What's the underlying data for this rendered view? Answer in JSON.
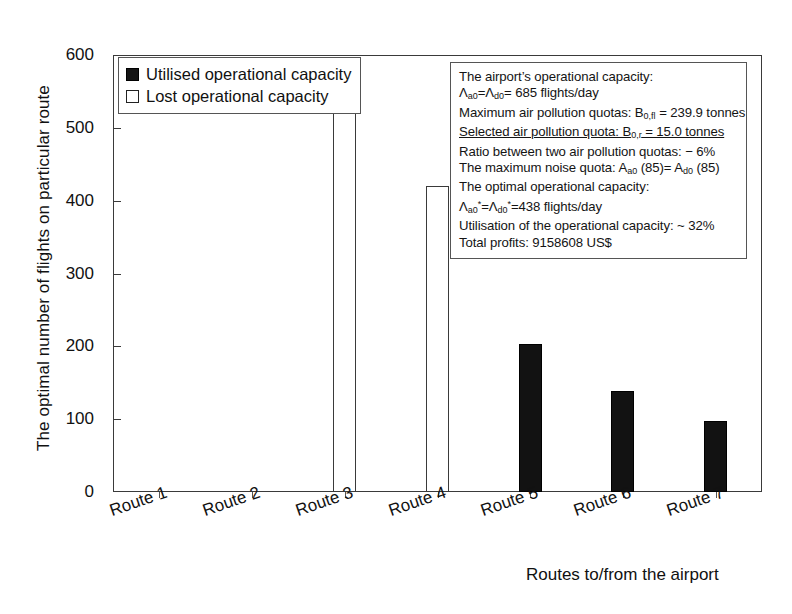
{
  "chart_data": {
    "type": "bar",
    "title": "",
    "xlabel": "Routes to/from the airport",
    "ylabel": "The optimal number of flights on particular route",
    "categories": [
      "Route 1",
      "Route 2",
      "Route 3",
      "Route 4",
      "Route 5",
      "Route 6",
      "Route 7"
    ],
    "values": [
      0,
      0,
      520,
      420,
      203,
      139,
      97
    ],
    "series": [
      {
        "name": "Utilised operational capacity",
        "style": "filled",
        "values": [
          0,
          0,
          0,
          0,
          203,
          139,
          97
        ]
      },
      {
        "name": "Lost operational capacity",
        "style": "hollow",
        "values": [
          0,
          0,
          520,
          420,
          0,
          0,
          0
        ]
      }
    ],
    "ylim": [
      0,
      600
    ],
    "yticks": [
      0,
      100,
      200,
      300,
      400,
      500,
      600
    ],
    "ytick_labels": [
      "0",
      "100",
      "200",
      "300",
      "400",
      "500",
      "600"
    ],
    "grid": false,
    "legend_position": "top-left"
  },
  "axes": {
    "y_title": "The optimal number of flights on particular route",
    "x_title": "Routes to/from the airport",
    "y_ticks": [
      "600",
      "500",
      "400",
      "300",
      "200",
      "100",
      "0"
    ],
    "x_ticks": [
      "Route 1",
      "Route 2",
      "Route 3",
      "Route 4",
      "Route 5",
      "Route 6",
      "Route 7"
    ]
  },
  "legend": {
    "items": [
      {
        "label": "Utilised operational capacity",
        "swatch": "filled"
      },
      {
        "label": "Lost operational capacity",
        "swatch": "hollow"
      }
    ]
  },
  "annotation": {
    "lines": [
      {
        "html": "The airport&rsquo;s operational capacity:",
        "underline": false
      },
      {
        "html": "&Lambda;<sub>a0</sub>=&Lambda;<sub>d0</sub>= 685 flights/day",
        "underline": false
      },
      {
        "html": "Maximum air pollution quotas: B<sub>0,fl</sub> = 239.9 tonnes",
        "underline": false
      },
      {
        "html": "Selected air pollution quota: B<sub>0,r</sub> = 15.0 tonnes",
        "underline": true
      },
      {
        "html": "Ratio between two air pollution quotas: &minus; 6%",
        "underline": false
      },
      {
        "html": "The maximum noise quota: A<sub>a0</sub> (85)= A<sub>d0</sub> (85)",
        "underline": false
      },
      {
        "html": "The optimal operational capacity:",
        "underline": false
      },
      {
        "html": "&Lambda;<sub>a0</sub><sup>*</sup>=&Lambda;<sub>d0</sub><sup>*</sup>=438 flights/day",
        "underline": false
      },
      {
        "html": "Utilisation of the operational capacity: ~ 32%",
        "underline": false
      },
      {
        "html": "Total profits: 9158608 US$",
        "underline": false
      }
    ]
  },
  "colors": {
    "filled_bar": "#121212",
    "hollow_bar": "#ffffff",
    "axis": "#3a3a3a",
    "background": "#ffffff",
    "text": "#111111"
  }
}
